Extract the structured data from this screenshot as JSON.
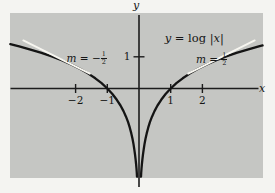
{
  "figure": {
    "title_parts": {
      "lhs": "y",
      "eq_func": " = log ",
      "lbar": "|",
      "arg": "x",
      "rbar": "|"
    },
    "y_axis_letter": "y",
    "x_axis_letter": "x",
    "slope_labels": {
      "left": {
        "var": "m",
        "rel": " = −",
        "frac_num": "1",
        "frac_den": "2"
      },
      "right": {
        "var": "m",
        "rel": " = ",
        "frac_num": "1",
        "frac_den": "2"
      }
    }
  },
  "colors": {
    "plot_bg": "#c5c6c3",
    "margin_bg": "#f4f4f1",
    "curve": "#141414",
    "tangent": "#f7f6f0",
    "axis": "#1c1c1c",
    "text": "#161616"
  },
  "chart_data": {
    "type": "line",
    "title": "y = log |x|",
    "xlabel": "x",
    "ylabel": "y",
    "xlim": [
      -4.07,
      3.91
    ],
    "ylim": [
      -2.83,
      2.38
    ],
    "grid": false,
    "x_ticks": [
      {
        "v": -2,
        "label": "−2"
      },
      {
        "v": -1,
        "label": "−1"
      },
      {
        "v": 1,
        "label": "1"
      },
      {
        "v": 2,
        "label": "2"
      }
    ],
    "y_ticks": [
      {
        "v": 1,
        "label": "1"
      }
    ],
    "series": [
      {
        "name": "log|x| left branch",
        "points": [
          [
            -4.06,
            1.401
          ],
          [
            -3.78,
            1.33
          ],
          [
            -3.45,
            1.238
          ],
          [
            -3.1,
            1.131
          ],
          [
            -2.75,
            1.012
          ],
          [
            -2.42,
            0.884
          ],
          [
            -2.12,
            0.751
          ],
          [
            -1.85,
            0.615
          ],
          [
            -1.6,
            0.47
          ],
          [
            -1.38,
            0.322
          ],
          [
            -1.18,
            0.166
          ],
          [
            -1.0,
            0
          ],
          [
            -0.84,
            -0.174
          ],
          [
            -0.7,
            -0.357
          ],
          [
            -0.585,
            -0.536
          ],
          [
            -0.49,
            -0.713
          ],
          [
            -0.41,
            -0.891
          ],
          [
            -0.345,
            -1.064
          ],
          [
            -0.29,
            -1.238
          ],
          [
            -0.243,
            -1.415
          ],
          [
            -0.205,
            -1.585
          ],
          [
            -0.173,
            -1.754
          ],
          [
            -0.147,
            -1.917
          ],
          [
            -0.125,
            -2.079
          ],
          [
            -0.107,
            -2.235
          ],
          [
            -0.092,
            -2.386
          ],
          [
            -0.08,
            -2.526
          ],
          [
            -0.07,
            -2.659
          ],
          [
            -0.062,
            -2.781
          ]
        ]
      },
      {
        "name": "log|x| right branch",
        "points": [
          [
            0.062,
            -2.781
          ],
          [
            0.07,
            -2.659
          ],
          [
            0.08,
            -2.526
          ],
          [
            0.092,
            -2.386
          ],
          [
            0.107,
            -2.235
          ],
          [
            0.125,
            -2.079
          ],
          [
            0.147,
            -1.917
          ],
          [
            0.173,
            -1.754
          ],
          [
            0.205,
            -1.585
          ],
          [
            0.243,
            -1.415
          ],
          [
            0.29,
            -1.238
          ],
          [
            0.345,
            -1.064
          ],
          [
            0.41,
            -0.891
          ],
          [
            0.49,
            -0.713
          ],
          [
            0.585,
            -0.536
          ],
          [
            0.7,
            -0.357
          ],
          [
            0.84,
            -0.174
          ],
          [
            1.0,
            0
          ],
          [
            1.18,
            0.166
          ],
          [
            1.38,
            0.322
          ],
          [
            1.6,
            0.47
          ],
          [
            1.85,
            0.615
          ],
          [
            2.12,
            0.751
          ],
          [
            2.42,
            0.884
          ],
          [
            2.75,
            1.012
          ],
          [
            3.1,
            1.131
          ],
          [
            3.45,
            1.238
          ],
          [
            3.78,
            1.33
          ],
          [
            3.9,
            1.361
          ]
        ]
      }
    ],
    "tangent_lines": [
      {
        "name": "tangent at x = -2",
        "slope": -0.5,
        "slope_label": "m = −1/2",
        "touch_point": [
          -2,
          0.693
        ],
        "points": [
          [
            -3.65,
            1.518
          ],
          [
            -1.55,
            0.468
          ]
        ]
      },
      {
        "name": "tangent at x = 2",
        "slope": 0.5,
        "slope_label": "m = 1/2",
        "touch_point": [
          2,
          0.693
        ],
        "points": [
          [
            1.55,
            0.468
          ],
          [
            3.65,
            1.518
          ]
        ]
      }
    ],
    "layout": {
      "canvas_px": [
        275,
        193
      ],
      "plot_area_px": {
        "left": 10,
        "top": 13,
        "right": 263,
        "bottom": 178
      },
      "origin_px": [
        139,
        88.5
      ],
      "px_per_unit": 31.7,
      "x_axis_span_px": [
        10.5,
        258.5
      ],
      "y_axis_span_px": [
        15,
        187
      ],
      "tick_half_len_px": 4.5,
      "tick_font_px": 10.5,
      "legend": "none"
    }
  }
}
